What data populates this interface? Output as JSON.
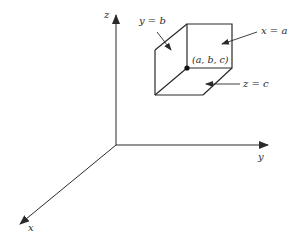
{
  "diagram": {
    "axes": {
      "x": {
        "label": "x"
      },
      "y": {
        "label": "y"
      },
      "z": {
        "label": "z"
      }
    },
    "planes": {
      "x_plane": {
        "label": "x = a"
      },
      "y_plane": {
        "label": "y = b"
      },
      "z_plane": {
        "label": "z = c"
      }
    },
    "point": {
      "label": "(a, b, c)"
    },
    "colors": {
      "line": "#2a2a2a",
      "background": "#ffffff"
    }
  }
}
